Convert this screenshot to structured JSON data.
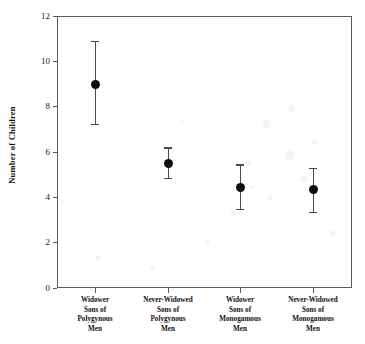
{
  "chart_data": {
    "type": "scatter",
    "title": "",
    "xlabel": "",
    "ylabel": "Number of Children",
    "ylim": [
      0,
      12
    ],
    "yticks": [
      0,
      2,
      4,
      6,
      8,
      10,
      12
    ],
    "ytick_labels": [
      "0",
      "2",
      "4",
      "6",
      "8",
      "10",
      "12"
    ],
    "grid": false,
    "legend": "none",
    "error_bars": "vertical, capped",
    "categories": [
      "Widower Sons of Polygynous Men",
      "Never-Widowed Sons of Polygynous Men",
      "Widower Sons of Monogamous Men",
      "Never-Widowed Sons of Monogamous Men"
    ],
    "category_lines": [
      [
        "Widower",
        "Sons of",
        "Polygynous",
        "Men"
      ],
      [
        "Never-Widowed",
        "Sons of",
        "Polygynous",
        "Men"
      ],
      [
        "Widower",
        "Sons of",
        "Monogamous",
        "Men"
      ],
      [
        "Never-Widowed",
        "Sons of",
        "Monogamous",
        "Men"
      ]
    ],
    "values": [
      9.0,
      5.5,
      4.45,
      4.35
    ],
    "error_low": [
      7.25,
      4.85,
      3.5,
      3.35
    ],
    "error_high": [
      10.9,
      6.2,
      5.45,
      5.3
    ],
    "marker": "filled-circle",
    "marker_color": "#0d0d0d",
    "line_color": "#4a4a4a",
    "axis_color": "#5a5a5a",
    "background": "#ffffff"
  }
}
